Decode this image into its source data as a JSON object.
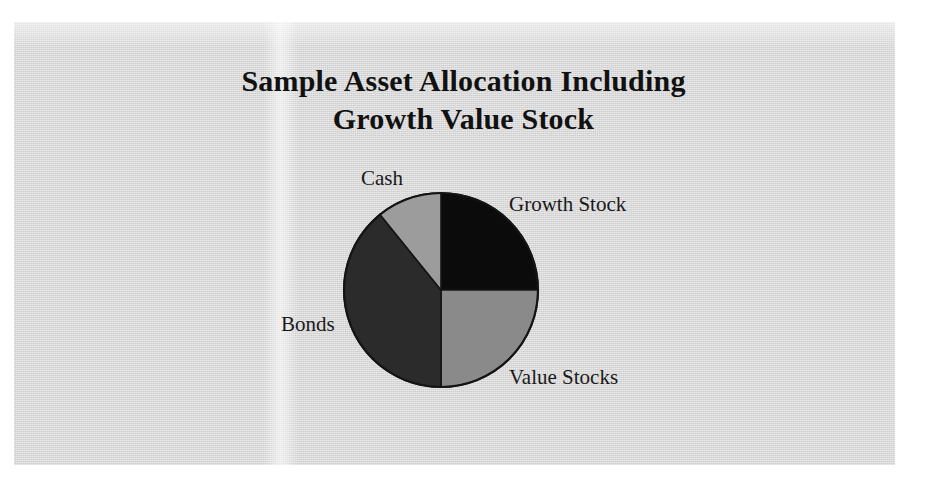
{
  "figure": {
    "title_line_1": "Sample Asset Allocation Including",
    "title_line_2": "Growth Value Stock",
    "page_background": "#ffffff",
    "paper_background": "#d9d9d9"
  },
  "chart_data": {
    "type": "pie",
    "title": "Sample Asset Allocation Including Growth Value Stock",
    "xlabel": "",
    "ylabel": "",
    "legend_position": "none",
    "labels_position": "outside",
    "grid": false,
    "start_angle_deg": 0,
    "direction": "clockwise",
    "categories": [
      "Growth Stock",
      "Value Stocks",
      "Bonds",
      "Cash"
    ],
    "values": [
      25,
      25,
      39,
      11
    ],
    "unit": "%",
    "slices": [
      {
        "label": "Growth Stock",
        "value": 25,
        "start_angle_deg": 0,
        "end_angle_deg": 90,
        "color": "#0b0b0b"
      },
      {
        "label": "Value Stocks",
        "value": 25,
        "start_angle_deg": 90,
        "end_angle_deg": 180,
        "color": "#8a8a8a"
      },
      {
        "label": "Bonds",
        "value": 39,
        "start_angle_deg": 180,
        "end_angle_deg": 321,
        "color": "#2b2b2b"
      },
      {
        "label": "Cash",
        "value": 11,
        "start_angle_deg": 321,
        "end_angle_deg": 360,
        "color": "#9c9c9c"
      }
    ],
    "outline_color": "#141414"
  }
}
